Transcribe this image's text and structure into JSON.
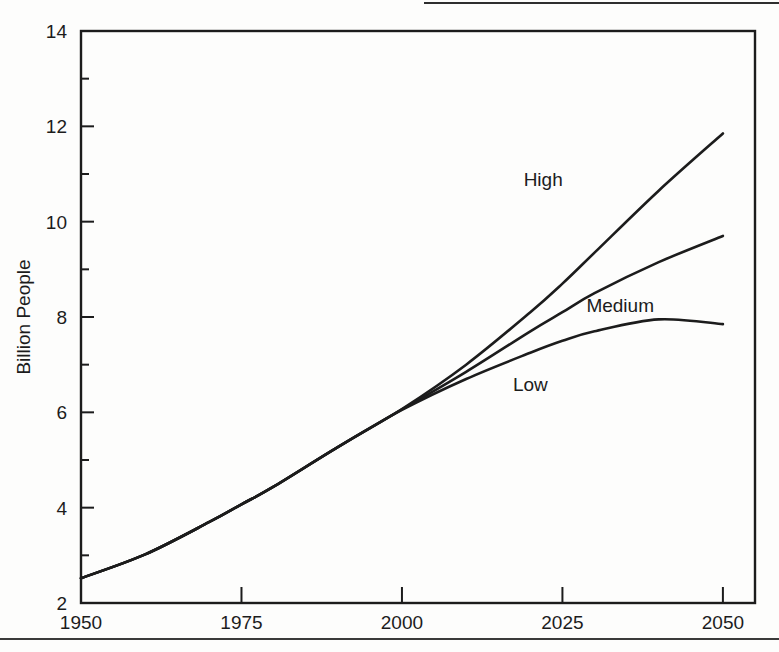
{
  "figure": {
    "background_color": "#fdfdfc",
    "ink_color": "#1c1c1c"
  },
  "chart_data": {
    "type": "line",
    "title": "",
    "xlabel": "",
    "ylabel": "Billion People",
    "xlim": [
      1950,
      2055
    ],
    "ylim": [
      2,
      14
    ],
    "grid": false,
    "legend_position": "inline-labels",
    "x_ticks": [
      1950,
      1975,
      2000,
      2025,
      2050
    ],
    "x_tick_labels": [
      "1950",
      "1975",
      "2000",
      "2025",
      "2050"
    ],
    "y_ticks": [
      2,
      4,
      6,
      8,
      10,
      12,
      14
    ],
    "y_tick_labels": [
      "2",
      "4",
      "6",
      "8",
      "10",
      "12",
      "14"
    ],
    "y_minor_ticks": [
      3,
      5,
      7,
      9,
      11,
      13
    ],
    "x": [
      1950,
      1960,
      1970,
      1975,
      1980,
      1990,
      2000,
      2010,
      2020,
      2025,
      2030,
      2040,
      2050
    ],
    "series": [
      {
        "name": "High",
        "label": "High",
        "values": [
          2.52,
          3.02,
          3.7,
          4.07,
          4.44,
          5.27,
          6.07,
          7.0,
          8.1,
          8.7,
          9.35,
          10.65,
          11.85
        ]
      },
      {
        "name": "Medium",
        "label": "Medium",
        "values": [
          2.52,
          3.02,
          3.7,
          4.07,
          4.44,
          5.27,
          6.06,
          6.85,
          7.7,
          8.1,
          8.5,
          9.15,
          9.7
        ]
      },
      {
        "name": "Low",
        "label": "Low",
        "values": [
          2.52,
          3.02,
          3.7,
          4.07,
          4.44,
          5.27,
          6.05,
          6.7,
          7.25,
          7.5,
          7.7,
          7.95,
          7.85
        ]
      }
    ],
    "annotations": [
      {
        "text": "High",
        "x": 2022,
        "y": 10.75
      },
      {
        "text": "Medium",
        "x": 2034,
        "y": 8.1
      },
      {
        "text": "Low",
        "x": 2020,
        "y": 6.45
      }
    ]
  }
}
